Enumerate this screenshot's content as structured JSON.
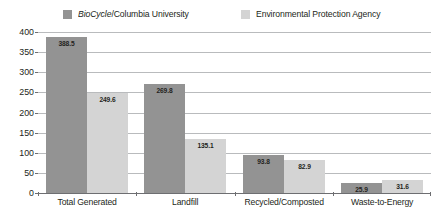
{
  "chart_data": {
    "type": "bar",
    "title": "",
    "xlabel": "",
    "ylabel": "",
    "ylim": [
      0,
      400
    ],
    "ytick_step": 50,
    "yticks": [
      "400",
      "350",
      "300",
      "250",
      "200",
      "150",
      "100",
      "50",
      "0"
    ],
    "grid": true,
    "legend_position": "top",
    "categories": [
      "Total Generated",
      "Landfill",
      "Recycled/Composted",
      "Waste-to-Energy"
    ],
    "series": [
      {
        "name": "BioCycle/Columbia University",
        "name_italic_part": "BioCycle",
        "name_plain_part": "/Columbia University",
        "color": "#939393",
        "values": [
          388.5,
          269.8,
          93.8,
          25.9
        ],
        "labels": [
          "388.5",
          "269.8",
          "93.8",
          "25.9"
        ]
      },
      {
        "name": "Environmental Protection Agency",
        "color": "#d4d4d4",
        "values": [
          249.6,
          135.1,
          82.9,
          31.6
        ],
        "labels": [
          "249.6",
          "135.1",
          "82.9",
          "31.6"
        ]
      }
    ]
  },
  "colors": {
    "series_1": "#939393",
    "series_2": "#d4d4d4",
    "gridline": "#b9bbbd",
    "axis": "#6d6e71",
    "text": "#231f20",
    "background": "#ffffff"
  }
}
